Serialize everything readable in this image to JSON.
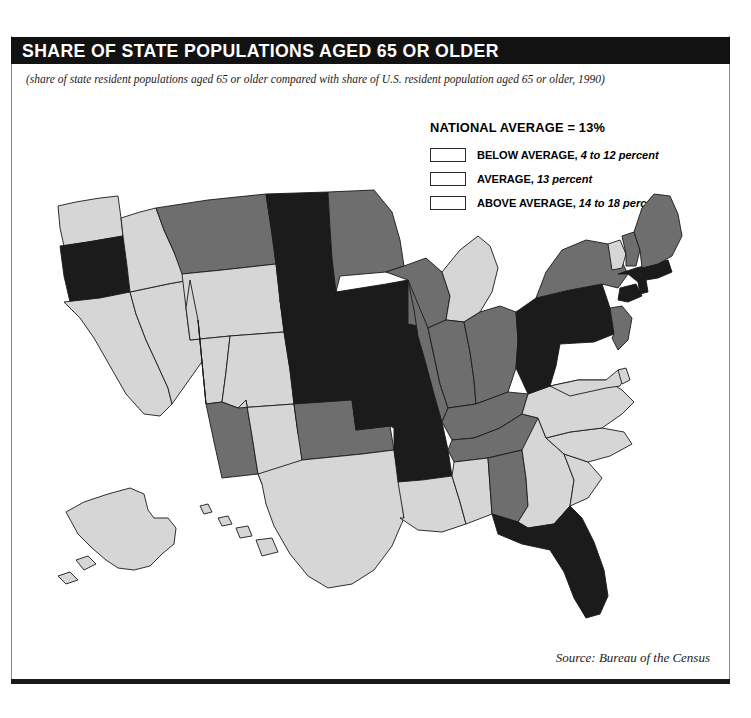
{
  "header": {
    "title": "SHARE OF STATE POPULATIONS AGED 65 OR OLDER",
    "subtitle": "(share of state resident populations aged 65 or older compared with share of U.S. resident population aged 65 or older, 1990)"
  },
  "legend": {
    "title": "NATIONAL AVERAGE = 13%",
    "items": [
      {
        "key": "below",
        "label": "BELOW AVERAGE,",
        "range": "4 to 12 percent",
        "color": "#d6d6d6"
      },
      {
        "key": "average",
        "label": "AVERAGE,",
        "range": "13 percent",
        "color": "#6e6e6e"
      },
      {
        "key": "above",
        "label": "ABOVE AVERAGE,",
        "range": "14 to 18 percent",
        "color": "#1b1b1b"
      }
    ]
  },
  "footer": {
    "source": "Source: Bureau of the Census"
  },
  "chart_data": {
    "type": "map",
    "title": "SHARE OF STATE POPULATIONS AGED 65 OR OLDER",
    "subtitle": "(share of state resident populations aged 65 or older compared with share of U.S. resident population aged 65 or older, 1990)",
    "national_average_percent": 13,
    "classes": [
      {
        "key": "below",
        "label": "BELOW AVERAGE",
        "range": "4 to 12 percent",
        "color": "#d6d6d6"
      },
      {
        "key": "average",
        "label": "AVERAGE",
        "range": "13 percent",
        "color": "#6e6e6e"
      },
      {
        "key": "above",
        "label": "ABOVE AVERAGE",
        "range": "14 to 18 percent",
        "color": "#1b1b1b"
      }
    ],
    "legend_position": "top-right",
    "source": "Source: Bureau of the Census",
    "states": {
      "AL": "average",
      "AK": "below",
      "AZ": "average",
      "AR": "above",
      "CA": "below",
      "CO": "below",
      "CT": "above",
      "DE": "below",
      "FL": "above",
      "GA": "below",
      "HI": "below",
      "ID": "below",
      "IL": "average",
      "IN": "average",
      "IA": "above",
      "KS": "above",
      "KY": "average",
      "LA": "below",
      "ME": "average",
      "MD": "below",
      "MA": "above",
      "MI": "below",
      "MN": "average",
      "MS": "below",
      "MO": "above",
      "MT": "average",
      "NE": "above",
      "NV": "below",
      "NH": "average",
      "NJ": "average",
      "NM": "below",
      "NY": "average",
      "NC": "below",
      "ND": "above",
      "OH": "average",
      "OK": "average",
      "OR": "above",
      "PA": "above",
      "RI": "above",
      "SC": "below",
      "SD": "above",
      "TN": "average",
      "TX": "below",
      "UT": "below",
      "VT": "below",
      "VA": "below",
      "WA": "below",
      "WV": "above",
      "WI": "average",
      "WY": "below"
    },
    "class_counts": {
      "below": 22,
      "average": 16,
      "above": 12
    }
  }
}
